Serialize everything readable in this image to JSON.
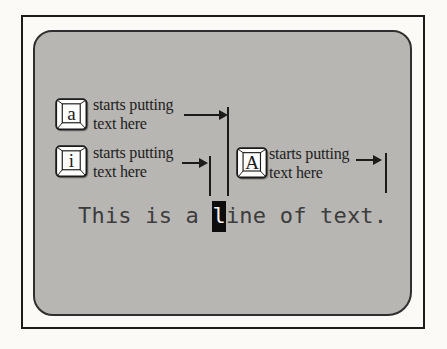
{
  "palette": {
    "page_bg": "#fbfaf6",
    "ink": "#1b1b1b",
    "screen_bg": "#b7b6b3",
    "screen_border": "#2f2f2f",
    "label_ink": "#222120",
    "terminal_ink": "#3c3c3c",
    "cursor_bg": "#0d0d0d",
    "cursor_fg": "#f4f4f4",
    "key_face": "#fdfdfb"
  },
  "keys": [
    {
      "letter": "a",
      "label_line1": "starts putting",
      "label_line2": "text here"
    },
    {
      "letter": "i",
      "label_line1": "starts putting",
      "label_line2": "text here"
    },
    {
      "letter": "A",
      "label_line1": "starts putting",
      "label_line2": "text here"
    }
  ],
  "text_line": {
    "before_cursor": "This is a ",
    "cursor_char": "l",
    "after_cursor": "ine of text."
  }
}
